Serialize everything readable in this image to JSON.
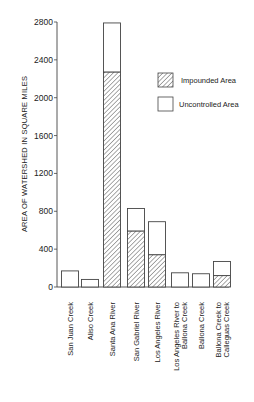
{
  "chart_data": {
    "type": "bar",
    "stacked": true,
    "title": "",
    "xlabel": "",
    "ylabel": "AREA OF WATERSHED IN SQUARE MILES",
    "ylim": [
      0,
      2800
    ],
    "yticks": [
      0,
      400,
      800,
      1200,
      1600,
      2000,
      2400,
      2800
    ],
    "grid": false,
    "legend_position": "upper right",
    "categories": [
      "San Juan Creek",
      "Aliso Creek",
      "Santa Ana River",
      "San Gabriel River",
      "Los Angeles River",
      "Los Angeles River to Ballona Creek",
      "Ballona Creek",
      "Ballona Creek to Calleguas Creek"
    ],
    "category_lines": [
      [
        "San Juan Creek"
      ],
      [
        "Aliso Creek"
      ],
      [
        "Santa Ana River"
      ],
      [
        "San Gabriel River"
      ],
      [
        "Los Angeles River"
      ],
      [
        "Los Angeles River to",
        "Ballona Creek"
      ],
      [
        "Ballona Creek"
      ],
      [
        "Ballona Creek to",
        "Calleguas Creek"
      ]
    ],
    "series": [
      {
        "name": "Impounded Area",
        "pattern": "hatched",
        "values": [
          0,
          0,
          2270,
          590,
          340,
          0,
          0,
          120
        ]
      },
      {
        "name": "Uncontrolled Area",
        "pattern": "open",
        "values": [
          170,
          80,
          520,
          240,
          350,
          150,
          140,
          150
        ]
      }
    ],
    "totals": [
      170,
      80,
      2790,
      830,
      690,
      150,
      140,
      270
    ]
  },
  "legend": {
    "impounded_label": "Impounded Area",
    "uncontrolled_label": "Uncontrolled Area"
  },
  "colors": {
    "ink": "#333333",
    "background": "#ffffff"
  }
}
